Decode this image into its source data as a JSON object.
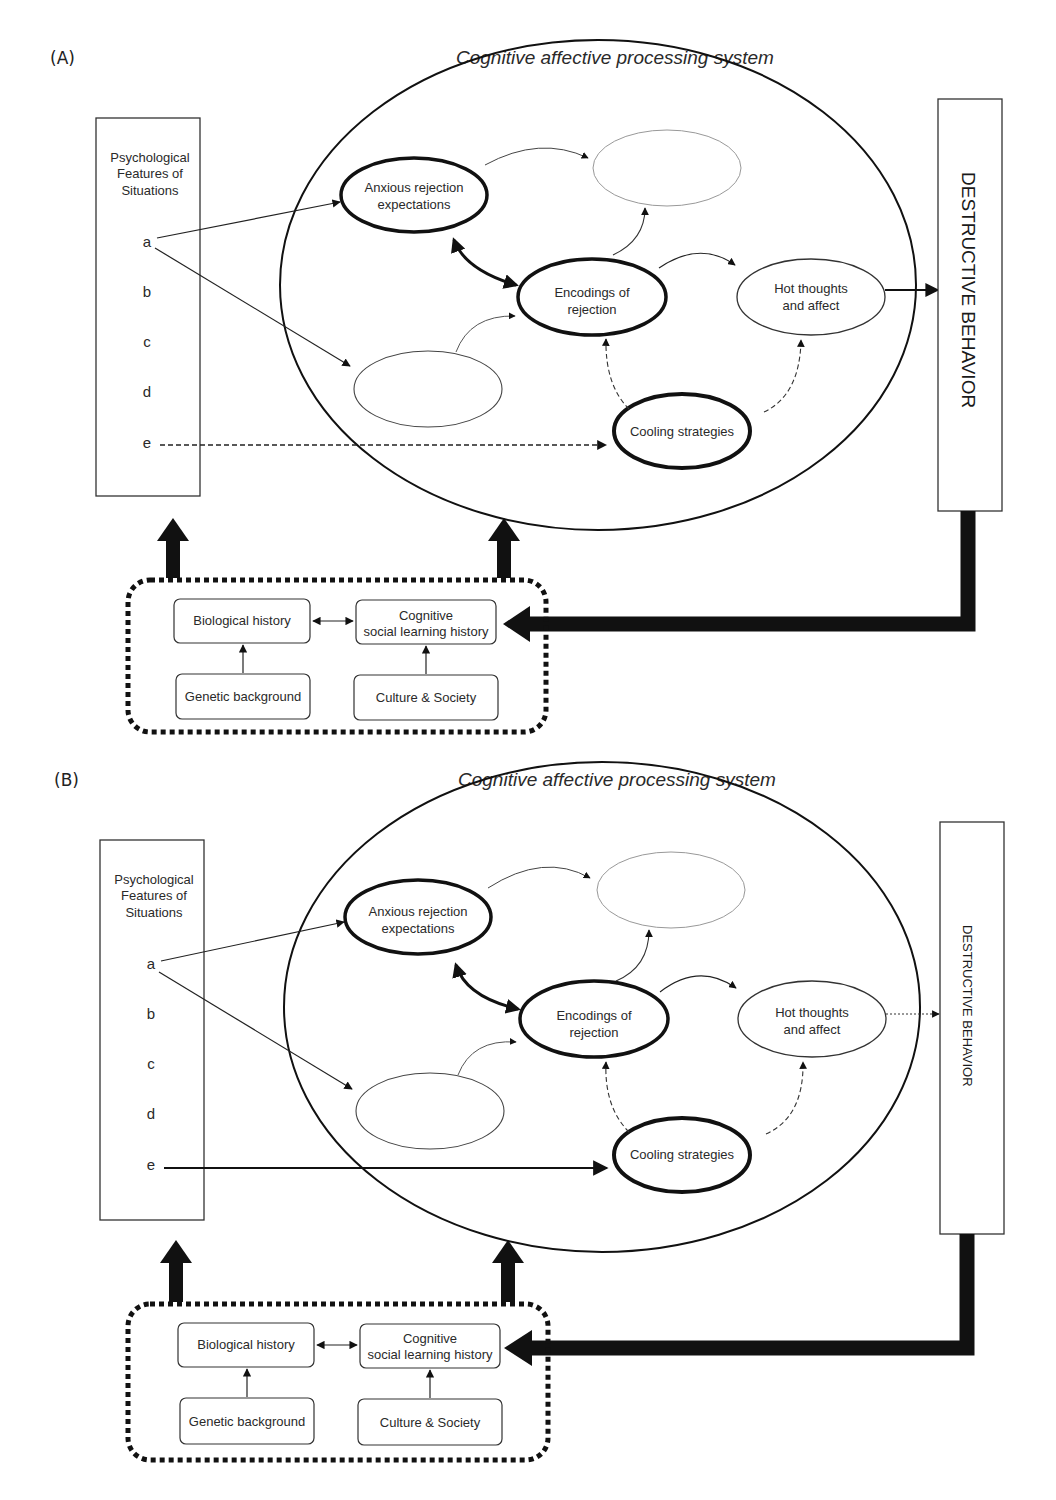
{
  "panels": [
    {
      "label": "(A)",
      "title": "Cognitive affective  processing system",
      "situations": {
        "line1": "Psychological",
        "line2": "Features of",
        "line3": "Situations",
        "features": [
          "a",
          "b",
          "c",
          "d",
          "e"
        ]
      },
      "nodes": {
        "anxious_1": "Anxious rejection",
        "anxious_2": "expectations",
        "encodings_1": "Encodings of",
        "encodings_2": "rejection",
        "hot_1": "Hot thoughts",
        "hot_2": "and affect",
        "cooling": "Cooling strategies"
      },
      "outcome": "DESTRUCTIVE BEHAVIOR",
      "e_link_style": "dashed",
      "hot_to_outcome_style": "solid",
      "history": {
        "biological": "Biological history",
        "cognitive_1": "Cognitive",
        "cognitive_2": "social learning history",
        "genetic": "Genetic background",
        "culture": "Culture & Society"
      }
    },
    {
      "label": "(B)",
      "title": "Cognitive affective  processing system",
      "situations": {
        "line1": "Psychological",
        "line2": "Features of",
        "line3": "Situations",
        "features": [
          "a",
          "b",
          "c",
          "d",
          "e"
        ]
      },
      "nodes": {
        "anxious_1": "Anxious rejection",
        "anxious_2": "expectations",
        "encodings_1": "Encodings of",
        "encodings_2": "rejection",
        "hot_1": "Hot thoughts",
        "hot_2": "and affect",
        "cooling": "Cooling strategies"
      },
      "outcome": "DESTRUCTIVE BEHAVIOR",
      "e_link_style": "solid",
      "hot_to_outcome_style": "dotted",
      "history": {
        "biological": "Biological history",
        "cognitive_1": "Cognitive",
        "cognitive_2": "social learning history",
        "genetic": "Genetic background",
        "culture": "Culture & Society"
      }
    }
  ]
}
